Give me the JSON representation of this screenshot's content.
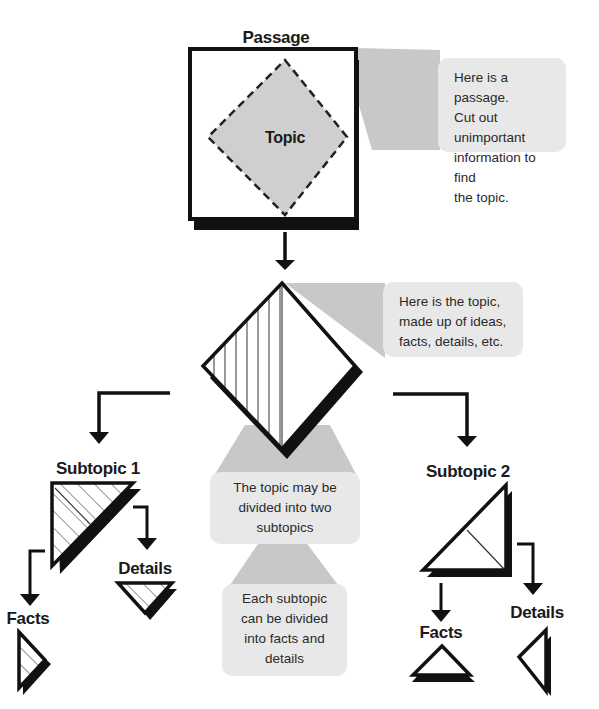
{
  "diagram": {
    "colors": {
      "stroke": "#111111",
      "topic_fill": "#cfcfcf",
      "callout_bg": "#e8e8e8",
      "callout_wedge": "#c8c8c8",
      "background": "#ffffff"
    },
    "nodes": {
      "passage": {
        "label": "Passage"
      },
      "topic": {
        "label": "Topic"
      },
      "subtopic1": {
        "label": "Subtopic 1"
      },
      "subtopic2": {
        "label": "Subtopic 2"
      },
      "subtopic1_facts": {
        "label": "Facts"
      },
      "subtopic1_details": {
        "label": "Details"
      },
      "subtopic2_facts": {
        "label": "Facts"
      },
      "subtopic2_details": {
        "label": "Details"
      }
    },
    "callouts": {
      "passage": {
        "lines": [
          "Here is a passage.",
          "Cut out unimportant",
          "information to find",
          "the topic."
        ]
      },
      "topic": {
        "lines": [
          "Here is the topic,",
          "made up of ideas,",
          "facts, details, etc."
        ]
      },
      "subtopics": {
        "lines": [
          "The topic may be",
          "divided into two",
          "subtopics"
        ]
      },
      "facts_details": {
        "lines": [
          "Each subtopic",
          "can be divided",
          "into facts and",
          "details"
        ]
      }
    }
  }
}
